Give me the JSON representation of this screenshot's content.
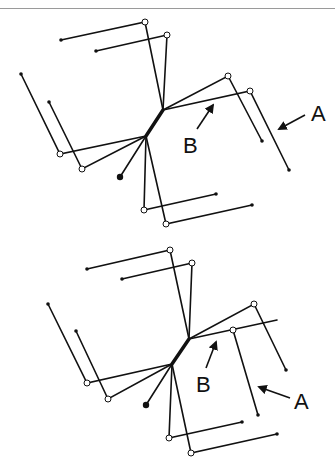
{
  "figure": {
    "panels": [
      {
        "id": "top",
        "labels": [
          {
            "text": "A",
            "x": 318,
            "y": 121
          },
          {
            "text": "B",
            "x": 189,
            "y": 153
          }
        ]
      },
      {
        "id": "bottom",
        "labels": [
          {
            "text": "A",
            "x": 302,
            "y": 409
          },
          {
            "text": "B",
            "x": 201,
            "y": 392
          }
        ]
      }
    ]
  },
  "colors": {
    "line": "#111111",
    "background": "#ffffff",
    "rule": "#9a9a9a"
  }
}
